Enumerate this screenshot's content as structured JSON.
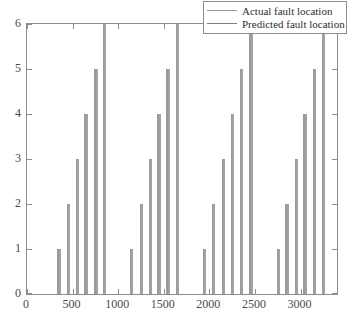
{
  "legend": {
    "position": "top-right",
    "entries": [
      {
        "label": "Actual fault location",
        "color": "#9d9d9d"
      },
      {
        "label": "Predicted fault location",
        "color": "#7c7c7c"
      }
    ]
  },
  "axes": {
    "x_ticks": [
      "0",
      "500",
      "1000",
      "1500",
      "2000",
      "2500",
      "3000"
    ],
    "y_ticks": [
      "0",
      "1",
      "2",
      "3",
      "4",
      "5",
      "6"
    ]
  },
  "chart_data": {
    "type": "bar",
    "title": "",
    "xlabel": "",
    "ylabel": "",
    "xlim": [
      0,
      3400
    ],
    "ylim": [
      0,
      6
    ],
    "grid": false,
    "legend_position": "upper right",
    "x_ticks": [
      0,
      500,
      1000,
      1500,
      2000,
      2500,
      3000
    ],
    "y_ticks": [
      0,
      1,
      2,
      3,
      4,
      5,
      6
    ],
    "series": [
      {
        "name": "Actual fault location",
        "color": "#9d9d9d",
        "x": [
          345,
          450,
          545,
          640,
          750,
          845,
          1140,
          1245,
          1345,
          1440,
          1540,
          1640,
          1940,
          2040,
          2145,
          2245,
          2345,
          2450,
          2750,
          2845,
          2945,
          3040,
          3145,
          3245
        ],
        "values": [
          1,
          2,
          3,
          4,
          5,
          6,
          1,
          2,
          3,
          4,
          5,
          6,
          1,
          2,
          3,
          4,
          5,
          6,
          1,
          2,
          3,
          4,
          5,
          6
        ]
      },
      {
        "name": "Predicted fault location",
        "color": "#7c7c7c",
        "x": [
          360,
          465,
          560,
          655,
          763,
          860,
          1155,
          1258,
          1358,
          1455,
          1555,
          1655,
          1955,
          2055,
          2160,
          2258,
          2360,
          2465,
          2765,
          2858,
          2960,
          3055,
          3158,
          3260
        ],
        "values": [
          1,
          2,
          3,
          4,
          5,
          6,
          1,
          2,
          3,
          4,
          5,
          6,
          1,
          2,
          3,
          4,
          5,
          6,
          1,
          2,
          3,
          4,
          5,
          6
        ]
      }
    ]
  }
}
